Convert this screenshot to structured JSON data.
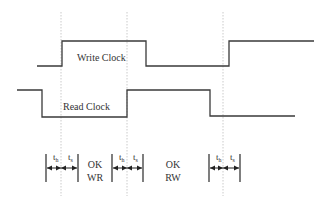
{
  "diagram": {
    "type": "timing-diagram",
    "signals": [
      {
        "name": "write-clock",
        "label": "Write Clock",
        "levels": [
          "low",
          "high",
          "low",
          "high"
        ]
      },
      {
        "name": "read-clock",
        "label": "Read Clock",
        "levels": [
          "high",
          "low",
          "high",
          "low"
        ]
      }
    ],
    "windows": [
      {
        "hold_label": "t",
        "hold_sub": "h",
        "setup_label": "t",
        "setup_sub": "s"
      },
      {
        "hold_label": "t",
        "hold_sub": "h",
        "setup_label": "t",
        "setup_sub": "s"
      },
      {
        "hold_label": "t",
        "hold_sub": "h",
        "setup_label": "t",
        "setup_sub": "s"
      }
    ],
    "regions": [
      {
        "line1": "OK",
        "line2": "WR"
      },
      {
        "line1": "OK",
        "line2": "RW"
      }
    ]
  }
}
